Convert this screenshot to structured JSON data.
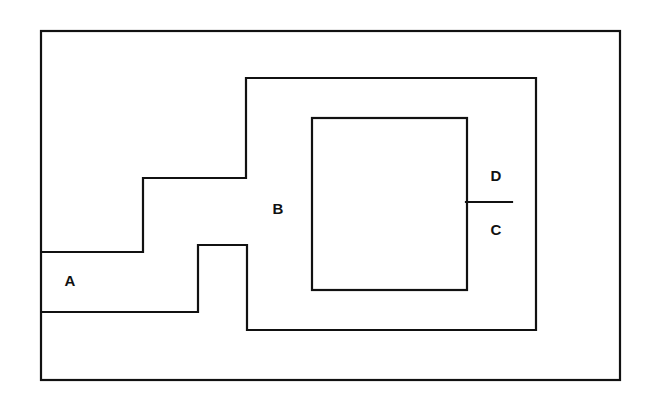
{
  "diagram": {
    "background_color": "#ffffff",
    "stroke_color": "#111111",
    "stroke_width": 2.2,
    "canvas": {
      "width": 657,
      "height": 405
    },
    "shapes": {
      "outer_boundary": {
        "name": "outer-rectangle",
        "type": "rect",
        "x": 41,
        "y": 31,
        "width": 579,
        "height": 349
      },
      "region_b_boundary": {
        "name": "stepped-polyline",
        "type": "polyline",
        "points": "42,252 143,252 143,178 246,178 246,78 536,78 536,330 247,330 247,245 198,245 198,312 42,312"
      },
      "region_c_inner": {
        "name": "inner-rectangle",
        "type": "rect",
        "x": 312,
        "y": 118,
        "width": 155,
        "height": 172
      },
      "d_tick": {
        "name": "tick-line",
        "type": "line",
        "x1": 466,
        "y1": 202,
        "x2": 512,
        "y2": 202
      }
    },
    "labels": [
      {
        "id": "A",
        "text": "A",
        "x": 70,
        "y": 282
      },
      {
        "id": "B",
        "text": "B",
        "x": 278,
        "y": 210
      },
      {
        "id": "D",
        "text": "D",
        "x": 496,
        "y": 177
      },
      {
        "id": "C",
        "text": "C",
        "x": 496,
        "y": 231
      }
    ]
  }
}
